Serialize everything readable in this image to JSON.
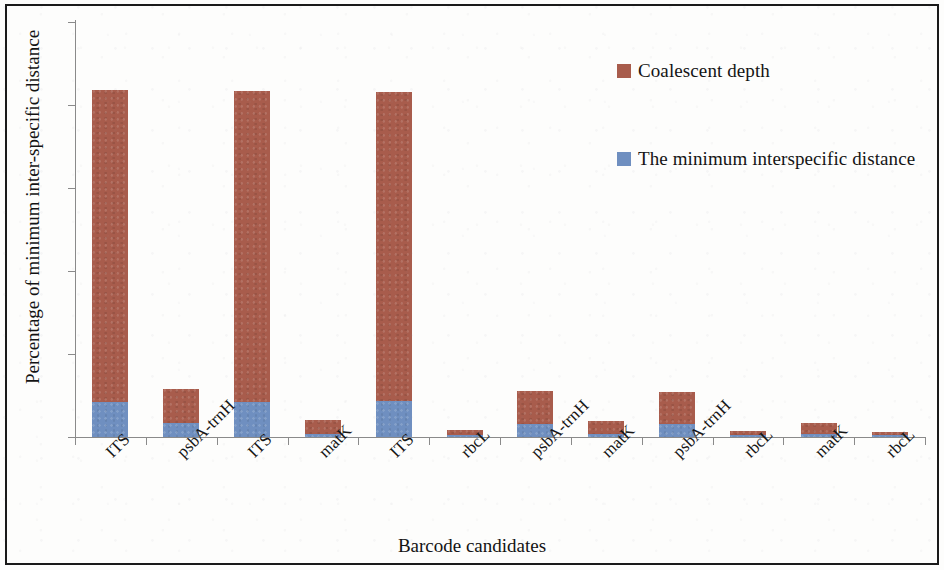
{
  "figure": {
    "border_color": "#1a1a1a",
    "background": "#fdfdfc"
  },
  "chart_data": {
    "type": "bar",
    "subtype": "stacked-vertical",
    "title": "",
    "xlabel": "Barcode candidates",
    "ylabel": "Percentage of minimum inter-specific distance",
    "categories": [
      "ITS",
      "psbA-trnH",
      "ITS",
      "matK",
      "ITS",
      "rbcL",
      "psbA-trnH",
      "matK",
      "psbA-trnH",
      "rbcL",
      "matK",
      "rbcL"
    ],
    "series": [
      {
        "name": "The minimum interspecific distance",
        "color": "#6f8fc0",
        "values": [
          0.21,
          0.085,
          0.21,
          0.02,
          0.215,
          0.012,
          0.08,
          0.02,
          0.08,
          0.01,
          0.02,
          0.012
        ]
      },
      {
        "name": "Coalescent depth",
        "color": "#a85c4c",
        "values": [
          1.88,
          0.205,
          1.875,
          0.08,
          1.865,
          0.028,
          0.195,
          0.075,
          0.19,
          0.025,
          0.065,
          0.018
        ]
      }
    ],
    "totals": [
      2.09,
      0.29,
      2.085,
      0.1,
      2.08,
      0.04,
      0.275,
      0.095,
      0.27,
      0.035,
      0.085,
      0.03
    ],
    "ylim": [
      0,
      2.5
    ],
    "yticks": [
      0,
      0.5,
      1,
      1.5,
      2,
      2.5
    ],
    "ytick_labels": [
      "0",
      "0.5",
      "1",
      "1.5",
      "2",
      "2.5"
    ],
    "grid": false,
    "legend_position": "top-right",
    "legend": [
      {
        "label": "Coalescent depth",
        "color": "#a85c4c"
      },
      {
        "label": "The minimum interspecific distance",
        "color": "#6f8fc0"
      }
    ]
  }
}
